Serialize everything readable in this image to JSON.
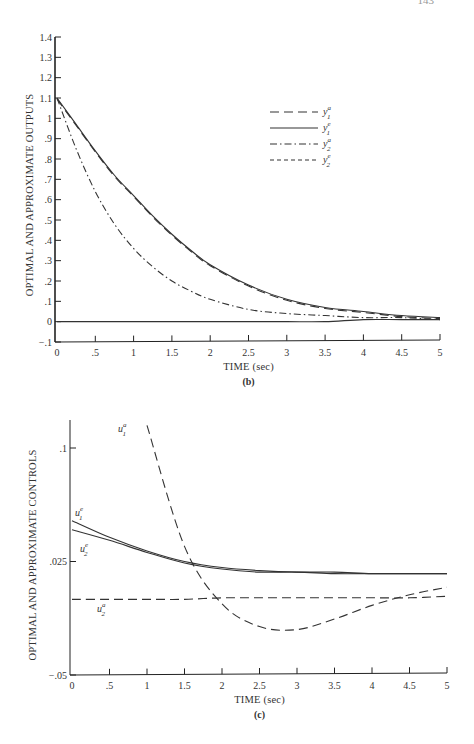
{
  "page": {
    "number": "143"
  },
  "chart_data": [
    {
      "id": "b",
      "type": "line",
      "caption": "(b)",
      "title": "",
      "xlabel": "TIME (sec)",
      "ylabel": "OPTIMAL AND APPROXIMATE OUTPUTS",
      "xlim": [
        0,
        5
      ],
      "ylim": [
        -0.1,
        1.4
      ],
      "x_ticks": [
        "0",
        ".5",
        "1",
        "1.5",
        "2",
        "2.5",
        "3",
        "3.5",
        "4",
        "4.5",
        "5"
      ],
      "y_ticks": [
        "1.4",
        "1.3",
        "1.2",
        "1.1",
        "1",
        ".9",
        ".8",
        ".7",
        ".6",
        ".5",
        ".4",
        ".3",
        ".2",
        ".1",
        "0",
        "-.1"
      ],
      "grid": false,
      "legend_position": "upper right",
      "legend": [
        {
          "label": "y",
          "sup": "a",
          "sub": "1",
          "style": "long-dash"
        },
        {
          "label": "y",
          "sup": "e",
          "sub": "1",
          "style": "solid"
        },
        {
          "label": "y",
          "sup": "a",
          "sub": "2",
          "style": "dash-dot"
        },
        {
          "label": "y",
          "sup": "e",
          "sub": "2",
          "style": "short-dash"
        }
      ],
      "x": [
        0,
        0.25,
        0.5,
        0.75,
        1,
        1.25,
        1.5,
        1.75,
        2,
        2.5,
        3,
        3.5,
        4,
        4.5,
        5
      ],
      "series": [
        {
          "name": "y1 optimal/approx (upper decay)",
          "style": "solid/long-dash",
          "values": [
            1.1,
            0.97,
            0.84,
            0.72,
            0.62,
            0.52,
            0.43,
            0.35,
            0.28,
            0.18,
            0.11,
            0.07,
            0.05,
            0.03,
            0.02
          ]
        },
        {
          "name": "y2 optimal/approx (lower decay)",
          "style": "dash-dot",
          "values": [
            1.1,
            0.85,
            0.64,
            0.48,
            0.36,
            0.27,
            0.2,
            0.15,
            0.11,
            0.06,
            0.04,
            0.03,
            0.02,
            0.02,
            0.01
          ]
        },
        {
          "name": "zero line",
          "style": "solid",
          "values": [
            0,
            0,
            0,
            0,
            0,
            0,
            0,
            0,
            0,
            0,
            0,
            0,
            0.01,
            0.01,
            0.01
          ]
        }
      ]
    },
    {
      "id": "c",
      "type": "line",
      "caption": "(c)",
      "title": "",
      "xlabel": "TIME (sec)",
      "ylabel": "OPTIMAL AND APPROXIMATE CONTROLS",
      "xlim": [
        0,
        5
      ],
      "ylim": [
        -0.05,
        0.1
      ],
      "x_ticks": [
        "0",
        ".5",
        "1",
        "1.5",
        "2",
        "2.5",
        "3",
        "3.5",
        "4",
        "4.5",
        "5"
      ],
      "y_ticks": [
        ".1",
        ".025",
        "-.05"
      ],
      "grid": false,
      "annotations": [
        {
          "label": "u",
          "sup": "a",
          "sub": "1",
          "near": "steep dashed curve top"
        },
        {
          "label": "u",
          "sup": "e",
          "sub": "1",
          "near": "upper solid curve start"
        },
        {
          "label": "u",
          "sup": "e",
          "sub": "2",
          "near": "lower solid curve start"
        },
        {
          "label": "u",
          "sup": "a",
          "sub": "2",
          "near": "flat dashed line"
        }
      ],
      "x": [
        0,
        0.5,
        1,
        1.5,
        2,
        2.5,
        3,
        3.5,
        4,
        4.5,
        5
      ],
      "series": [
        {
          "name": "u1 e",
          "style": "solid",
          "values": [
            0.052,
            0.041,
            0.032,
            0.025,
            0.021,
            0.019,
            0.018,
            0.018,
            0.017,
            0.017,
            0.017
          ]
        },
        {
          "name": "u2 e",
          "style": "solid",
          "values": [
            0.046,
            0.039,
            0.031,
            0.024,
            0.02,
            0.018,
            0.018,
            0.017,
            0.017,
            0.017,
            0.017
          ]
        },
        {
          "name": "u1 a",
          "style": "long-dash",
          "values": [
            null,
            null,
            0.115,
            0.035,
            -0.003,
            -0.018,
            -0.02,
            -0.013,
            -0.004,
            0.003,
            0.008
          ]
        },
        {
          "name": "u2 a",
          "style": "long-dash",
          "values": [
            0.0,
            0.0,
            0.0,
            0.0,
            0.001,
            0.001,
            0.001,
            0.001,
            0.001,
            0.001,
            0.002
          ]
        }
      ]
    }
  ]
}
